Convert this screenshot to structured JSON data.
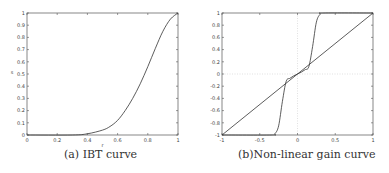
{
  "chart_data": [
    {
      "type": "line",
      "caption": "(a) IBT curve",
      "xlabel": "r",
      "ylabel": "s",
      "xlim": [
        0,
        1
      ],
      "ylim": [
        0,
        1
      ],
      "xticks": [
        "0",
        "0.2",
        "0.4",
        "0.6",
        "0.8",
        "1"
      ],
      "yticks": [
        "0",
        "0.1",
        "0.2",
        "0.3",
        "0.4",
        "0.5",
        "0.6",
        "0.7",
        "0.8",
        "0.9",
        "1"
      ],
      "grid": false,
      "series": [
        {
          "name": "IBT",
          "x": [
            0,
            0.3,
            0.4,
            0.5,
            0.55,
            0.6,
            0.65,
            0.7,
            0.75,
            0.8,
            0.85,
            0.9,
            0.95,
            1.0
          ],
          "values": [
            0,
            0.0,
            0.01,
            0.04,
            0.07,
            0.12,
            0.2,
            0.3,
            0.42,
            0.56,
            0.71,
            0.85,
            0.95,
            1.0
          ]
        }
      ]
    },
    {
      "type": "line",
      "caption": "(b)Non-linear gain curve",
      "xlabel": "",
      "ylabel": "",
      "xlim": [
        -1,
        1
      ],
      "ylim": [
        -1,
        1
      ],
      "xticks": [
        "-1",
        "-0.5",
        "0",
        "0.5",
        "1"
      ],
      "yticks": [
        "-1",
        "-0.8",
        "-0.6",
        "-0.4",
        "-0.2",
        "0",
        "0.2",
        "0.4",
        "0.6",
        "0.8",
        "1"
      ],
      "grid": "dotted lines at x=0 and y=0",
      "series": [
        {
          "name": "identity",
          "x": [
            -1,
            1
          ],
          "values": [
            -1,
            1
          ]
        },
        {
          "name": "gain",
          "x": [
            -1,
            -0.35,
            -0.3,
            -0.25,
            -0.2,
            -0.15,
            -0.1,
            -0.05,
            0,
            0.05,
            0.1,
            0.15,
            0.2,
            0.25,
            0.3,
            0.35,
            1
          ],
          "values": [
            -1,
            -1,
            -0.98,
            -0.85,
            -0.45,
            -0.12,
            -0.07,
            -0.03,
            0,
            0.03,
            0.07,
            0.12,
            0.45,
            0.85,
            0.98,
            1,
            1
          ]
        }
      ]
    }
  ]
}
